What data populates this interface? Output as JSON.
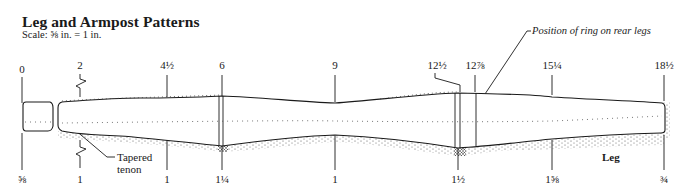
{
  "header": {
    "title": "Leg and Armpost Patterns",
    "scale": "Scale: ⅝ in. = 1 in."
  },
  "top_measurements": [
    {
      "label": "0",
      "x": 22
    },
    {
      "label": "2",
      "x": 80
    },
    {
      "label": "4½",
      "x": 167
    },
    {
      "label": "6",
      "x": 222
    },
    {
      "label": "9",
      "x": 335
    },
    {
      "label": "12½",
      "x": 458
    },
    {
      "label": "12⅞",
      "x": 475
    },
    {
      "label": "15¼",
      "x": 552
    },
    {
      "label": "18½",
      "x": 664
    }
  ],
  "bottom_measurements": [
    {
      "label": "⅝",
      "x": 22
    },
    {
      "label": "1",
      "x": 80
    },
    {
      "label": "1",
      "x": 167
    },
    {
      "label": "1¼",
      "x": 222
    },
    {
      "label": "1",
      "x": 335
    },
    {
      "label": "1½",
      "x": 458
    },
    {
      "label": "1⅝",
      "x": 552
    },
    {
      "label": "¾",
      "x": 664
    }
  ],
  "annotations": {
    "ring_position": "Position of ring on rear legs",
    "tenon_line1": "Tapered",
    "tenon_line2": "tenon",
    "part_name": "Leg"
  },
  "colors": {
    "ink": "#1a1a1a",
    "paper": "#ffffff"
  }
}
